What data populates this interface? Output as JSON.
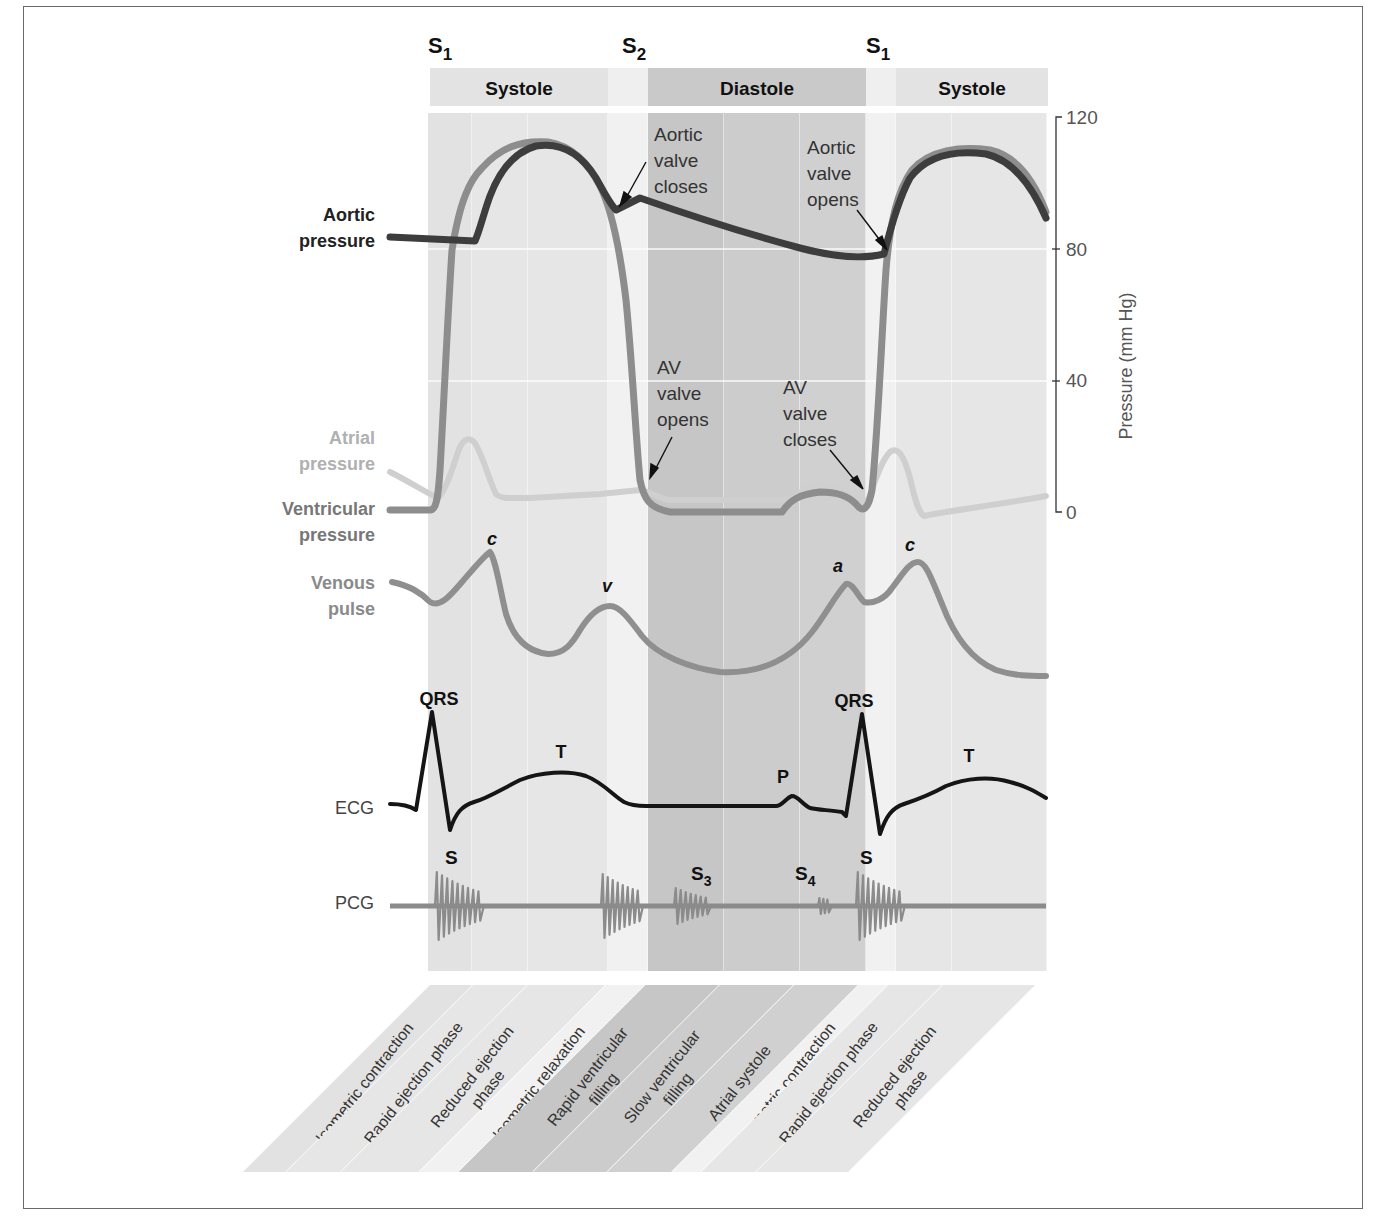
{
  "figure": {
    "heart_sounds_top": [
      {
        "main": "S",
        "sub": "1",
        "x": 428
      },
      {
        "main": "S",
        "sub": "2",
        "x": 622
      },
      {
        "main": "S",
        "sub": "1",
        "x": 866
      }
    ],
    "phase_header": [
      {
        "label": "Systole",
        "x0": 430,
        "x1": 608,
        "shade": "#e3e3e3"
      },
      {
        "label": "",
        "x0": 608,
        "x1": 648,
        "shade": "#efefef"
      },
      {
        "label": "Diastole",
        "x0": 648,
        "x1": 866,
        "shade": "#c9c9c9"
      },
      {
        "label": "",
        "x0": 866,
        "x1": 896,
        "shade": "#efefef"
      },
      {
        "label": "Systole",
        "x0": 896,
        "x1": 1048,
        "shade": "#e3e3e3"
      }
    ],
    "columns": [
      {
        "x0": 428,
        "x1": 472,
        "shade": "#e2e2e2"
      },
      {
        "x0": 472,
        "x1": 528,
        "shade": "#e6e6e6"
      },
      {
        "x0": 528,
        "x1": 608,
        "shade": "#e6e6e6"
      },
      {
        "x0": 608,
        "x1": 648,
        "shade": "#f1f1f1"
      },
      {
        "x0": 648,
        "x1": 724,
        "shade": "#c6c6c6"
      },
      {
        "x0": 724,
        "x1": 800,
        "shade": "#cccccc"
      },
      {
        "x0": 800,
        "x1": 866,
        "shade": "#d0d0d0"
      },
      {
        "x0": 866,
        "x1": 896,
        "shade": "#f1f1f1"
      },
      {
        "x0": 896,
        "x1": 952,
        "shade": "#e6e6e6"
      },
      {
        "x0": 952,
        "x1": 1047,
        "shade": "#e6e6e6"
      }
    ],
    "trace_labels": {
      "aortic": [
        "Aortic",
        "pressure"
      ],
      "atrial": [
        "Atrial",
        "pressure"
      ],
      "ventricular": [
        "Ventricular",
        "pressure"
      ],
      "venous": [
        "Venous",
        "pulse"
      ],
      "ecg": "ECG",
      "pcg": "PCG"
    },
    "annotations": {
      "aortic_valve_closes": [
        "Aortic",
        "valve",
        "closes"
      ],
      "aortic_valve_opens": [
        "Aortic",
        "valve",
        "opens"
      ],
      "av_valve_opens": [
        "AV",
        "valve",
        "opens"
      ],
      "av_valve_closes": [
        "AV",
        "valve",
        "closes"
      ]
    },
    "venous_waves": [
      {
        "label": "c",
        "x": 492,
        "y": 545
      },
      {
        "label": "v",
        "x": 607,
        "y": 592
      },
      {
        "label": "a",
        "x": 838,
        "y": 572
      },
      {
        "label": "c",
        "x": 910,
        "y": 551
      }
    ],
    "ecg_waves": [
      {
        "label": "QRS",
        "x": 439,
        "y": 705
      },
      {
        "label": "T",
        "x": 561,
        "y": 758
      },
      {
        "label": "P",
        "x": 783,
        "y": 783
      },
      {
        "label": "QRS",
        "x": 854,
        "y": 707
      },
      {
        "label": "T",
        "x": 969,
        "y": 762
      }
    ],
    "pcg_sounds": [
      {
        "main": "S",
        "sub": "",
        "x": 453,
        "y": 864
      },
      {
        "main": "S",
        "sub": "3",
        "x": 699,
        "y": 880
      },
      {
        "main": "S",
        "sub": "4",
        "x": 803,
        "y": 880
      },
      {
        "main": "S",
        "sub": "",
        "x": 868,
        "y": 864
      }
    ],
    "axis": {
      "title": "Pressure (mm Hg)",
      "ticks": [
        {
          "label": "120",
          "value": 120
        },
        {
          "label": "80",
          "value": 80
        },
        {
          "label": "40",
          "value": 40
        },
        {
          "label": "0",
          "value": 0
        }
      ]
    },
    "bottom_phases": [
      {
        "label": [
          "Isometric contraction"
        ],
        "shade": "#e2e2e2"
      },
      {
        "label": [
          "Rapid ejection phase"
        ],
        "shade": "#e6e6e6"
      },
      {
        "label": [
          "Reduced ejection",
          "phase"
        ],
        "shade": "#e6e6e6"
      },
      {
        "label": [
          "Isometric relaxation"
        ],
        "shade": "#f1f1f1"
      },
      {
        "label": [
          "Rapid ventricular",
          "filling"
        ],
        "shade": "#c6c6c6"
      },
      {
        "label": [
          "Slow ventricular",
          "filling"
        ],
        "shade": "#cccccc"
      },
      {
        "label": [
          "Atrial systole"
        ],
        "shade": "#d0d0d0"
      },
      {
        "label": [
          "Isometric contraction"
        ],
        "shade": "#f1f1f1"
      },
      {
        "label": [
          "Rapid ejection phase"
        ],
        "shade": "#e6e6e6"
      },
      {
        "label": [
          "Reduced ejection",
          "phase"
        ],
        "shade": "#e6e6e6"
      }
    ],
    "colors": {
      "aortic": "#3c3c3c",
      "ventricular": "#8a8a8a",
      "atrial": "#c4c4c4",
      "venous": "#8e8e8e",
      "ecg": "#111111",
      "pcg": "#888888",
      "label_dark": "#222222",
      "label_mid": "#777777",
      "label_light": "#b0b0b0"
    }
  },
  "chart_data": {
    "type": "line",
    "ylabel": "Pressure (mm Hg)",
    "ylim": [
      0,
      120
    ],
    "x_unit": "relative time across one-and-a-half cardiac cycles",
    "series": [
      {
        "name": "Aortic pressure",
        "values_mmHg": {
          "baseline": 80,
          "peak": 120,
          "dicrotic_notch": 92,
          "end_diastolic": 80
        }
      },
      {
        "name": "Ventricular pressure",
        "values_mmHg": {
          "end_diastolic": 0,
          "peak": 120,
          "minimum": 0
        }
      },
      {
        "name": "Atrial pressure",
        "values_mmHg": {
          "c_peak": 22,
          "plateau": 7,
          "atrial_systole_peak": 5
        }
      },
      {
        "name": "Venous pulse",
        "waves": [
          "c",
          "v",
          "a",
          "c"
        ]
      },
      {
        "name": "ECG",
        "waves": [
          "QRS",
          "T",
          "P",
          "QRS",
          "T"
        ]
      },
      {
        "name": "PCG",
        "sounds": [
          "S1",
          "S2",
          "S3",
          "S4",
          "S1"
        ]
      }
    ]
  }
}
